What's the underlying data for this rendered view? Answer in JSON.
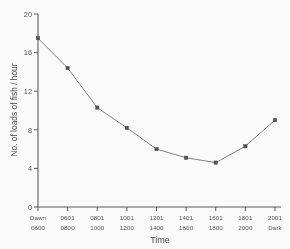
{
  "chart_data": {
    "type": "line",
    "title": "",
    "xlabel": "Time",
    "ylabel": "No. of loads of fish / hour",
    "ylim": [
      0,
      20
    ],
    "yticks": [
      0,
      4,
      8,
      12,
      16,
      20
    ],
    "ytick_labels": [
      "0",
      "4",
      "8",
      "12",
      "16",
      "20"
    ],
    "grid": false,
    "legend": "none",
    "marker": "square",
    "categories": [
      "Dawn",
      "0601",
      "0801",
      "1001",
      "1201",
      "1401",
      "1601",
      "1801",
      "2001"
    ],
    "xtick_labels_row1": [
      "Dawn",
      "0601",
      "0801",
      "1001",
      "1201",
      "1401",
      "1601",
      "1801",
      "2001"
    ],
    "xtick_labels_row2": [
      "0600",
      "0800",
      "1000",
      "1200",
      "1400",
      "1600",
      "1800",
      "2000",
      "Dark"
    ],
    "values": [
      17.5,
      14.4,
      10.3,
      8.2,
      6.0,
      5.1,
      4.6,
      6.3,
      9.0
    ],
    "series": [
      {
        "name": "No. of loads of fish / hour",
        "values": [
          17.5,
          14.4,
          10.3,
          8.2,
          6.0,
          5.1,
          4.6,
          6.3,
          9.0
        ]
      }
    ],
    "colors": {
      "line": "#6d6e72",
      "marker": "#4a4b4f",
      "axis": "#55565a",
      "text": "#4c4d51",
      "background": "#ffffff"
    }
  }
}
